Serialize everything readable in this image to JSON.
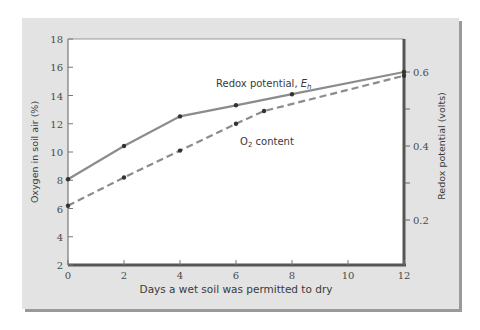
{
  "chart_data": {
    "type": "line",
    "title": "",
    "xlabel": "Days a wet soil was permitted to dry",
    "ylabel": "Oxygen in soil air (%)",
    "ylabel_right": "Redox potential (volts)",
    "xlim": [
      0,
      12
    ],
    "ylim": [
      2,
      18
    ],
    "ylim_right": [
      0.1,
      0.7
    ],
    "x_ticks": [
      "0",
      "2",
      "4",
      "6",
      "8",
      "10",
      "12"
    ],
    "y_ticks": [
      "2",
      "4",
      "6",
      "8",
      "10",
      "12",
      "14",
      "16",
      "18"
    ],
    "y_ticks_right": [
      "0.2",
      "0.4",
      "0.6"
    ],
    "grid": false,
    "series": [
      {
        "name": "Redox potential, Eh",
        "axis": "right",
        "style": "solid",
        "x": [
          0,
          2,
          4,
          6,
          8,
          12
        ],
        "values": [
          0.31,
          0.4,
          0.48,
          0.51,
          0.54,
          0.6
        ]
      },
      {
        "name": "O2 content",
        "axis": "left",
        "style": "dashed",
        "x": [
          0,
          2,
          4,
          6,
          7,
          12
        ],
        "values": [
          6.2,
          8.2,
          10.1,
          12.0,
          12.9,
          15.4
        ]
      }
    ],
    "annotations": [
      {
        "text": "Redox potential, E",
        "sub": "h",
        "series": "Redox potential, Eh"
      },
      {
        "text": "O",
        "sub": "2",
        "tail": " content",
        "series": "O2 content"
      }
    ]
  },
  "labels": {
    "xlabel": "Days a wet soil was permitted to dry",
    "ylabel": "Oxygen in soil air (%)",
    "ylabel_right": "Redox potential (volts)",
    "redox_main": "Redox potential, ",
    "redox_E": "E",
    "redox_sub": "h",
    "o2_main": "O",
    "o2_sub": "2",
    "o2_tail": " content"
  },
  "colors": {
    "panel": "#e3e3e3",
    "line": "#8c8c8c",
    "marker": "#333333",
    "axis": "#555555"
  }
}
